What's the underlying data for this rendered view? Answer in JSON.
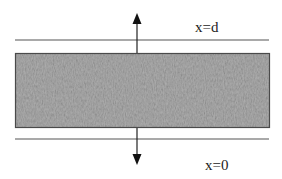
{
  "diagram": {
    "type": "slab-cross-section",
    "labels": {
      "top_boundary": "x=d",
      "bottom_boundary": "x=0"
    },
    "colors": {
      "slab_fill": "#9a9a9a",
      "slab_border": "#4a4a4a",
      "lines": "#555555",
      "arrows": "#111111"
    },
    "elements": {
      "slab": {
        "x": 15,
        "y": 53,
        "width": 255,
        "height": 75
      },
      "top_line": {
        "y": 40,
        "x1": 15,
        "x2": 269
      },
      "bottom_line": {
        "y": 139,
        "x1": 15,
        "x2": 269
      },
      "up_arrow": {
        "x": 137,
        "y_from": 53,
        "y_to": 14
      },
      "down_arrow": {
        "x": 137,
        "y_from": 128,
        "y_to": 164
      }
    }
  }
}
